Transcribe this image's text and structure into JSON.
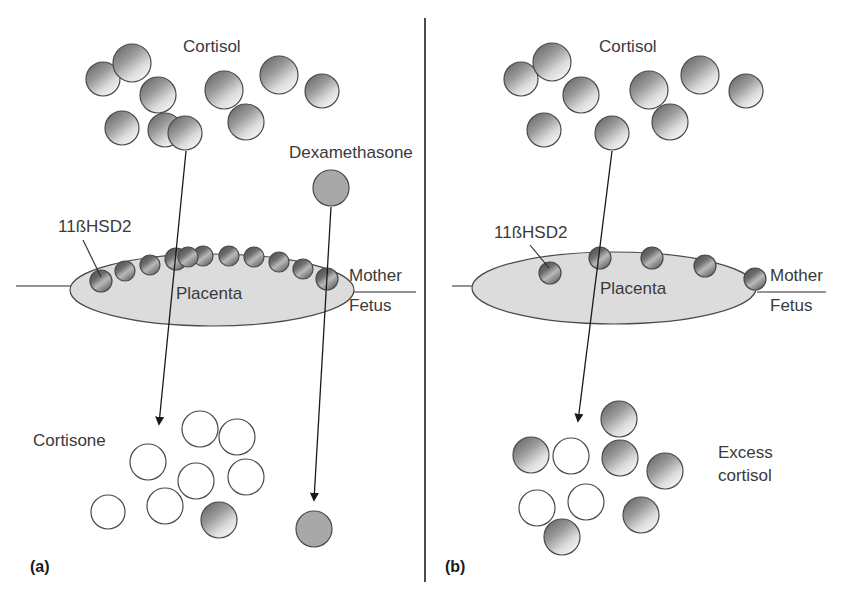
{
  "figure": {
    "width": 842,
    "height": 600,
    "background": "#ffffff",
    "divider": {
      "x": 425,
      "y1": 18,
      "y2": 582
    }
  },
  "colors": {
    "cortisol_dark": "#6f6f6f",
    "cortisol_light": "#f2f2f2",
    "cortisone_fill": "#ffffff",
    "dexamethasone_fill": "#a8a8a8",
    "enzyme_dark": "#4e4e4e",
    "enzyme_light": "#cfcfcf",
    "placenta_fill": "#dcdcdc",
    "outline": "#4a4a4a",
    "text": "#3a3a3a",
    "panel_letter": "#1a1a1a"
  },
  "panels": [
    {
      "id": "panel-a",
      "letter": "(a)",
      "letter_pos": {
        "x": 30,
        "y": 572
      },
      "labels": {
        "cortisol": {
          "text": "Cortisol",
          "x": 183,
          "y": 52
        },
        "dexamethasone": {
          "text": "Dexamethasone",
          "x": 289,
          "y": 158
        },
        "enzyme": {
          "text": "11ßHSD2",
          "x": 58,
          "y": 232
        },
        "placenta": {
          "text": "Placenta",
          "x": 176,
          "y": 299
        },
        "mother": {
          "text": "Mother",
          "x": 349,
          "y": 281
        },
        "fetus": {
          "text": "Fetus",
          "x": 349,
          "y": 311
        },
        "product": {
          "text": "Cortisone",
          "x": 33,
          "y": 446
        }
      },
      "placenta": {
        "cx": 212,
        "cy": 290,
        "rx": 142,
        "ry": 36
      },
      "maternal_line": {
        "x1": 16,
        "y1": 286,
        "x2": 96,
        "y2": 286
      },
      "fetal_line": {
        "x1": 336,
        "y1": 292,
        "x2": 416,
        "y2": 292
      },
      "enzyme_count": 11,
      "enzymes": [
        {
          "cx": 101,
          "cy": 281,
          "r": 11
        },
        {
          "cx": 125,
          "cy": 271,
          "r": 10
        },
        {
          "cx": 150,
          "cy": 265,
          "r": 10
        },
        {
          "cx": 176,
          "cy": 259,
          "r": 11
        },
        {
          "cx": 203,
          "cy": 256,
          "r": 10
        },
        {
          "cx": 229,
          "cy": 256,
          "r": 10
        },
        {
          "cx": 254,
          "cy": 257,
          "r": 10
        },
        {
          "cx": 279,
          "cy": 262,
          "r": 10
        },
        {
          "cx": 303,
          "cy": 269,
          "r": 10
        },
        {
          "cx": 327,
          "cy": 279,
          "r": 11
        },
        {
          "cx": 188,
          "cy": 257,
          "r": 10
        }
      ],
      "enzyme_leader": {
        "x1": 83,
        "y1": 240,
        "x2": 101,
        "y2": 277
      },
      "source_molecules": [
        {
          "cx": 103,
          "cy": 79,
          "r": 17
        },
        {
          "cx": 132,
          "cy": 63,
          "r": 19
        },
        {
          "cx": 158,
          "cy": 95,
          "r": 18
        },
        {
          "cx": 165,
          "cy": 130,
          "r": 17
        },
        {
          "cx": 122,
          "cy": 128,
          "r": 17
        },
        {
          "cx": 224,
          "cy": 90,
          "r": 19
        },
        {
          "cx": 246,
          "cy": 122,
          "r": 18
        },
        {
          "cx": 279,
          "cy": 75,
          "r": 19
        },
        {
          "cx": 322,
          "cy": 91,
          "r": 17
        }
      ],
      "transport_molecule": {
        "cx": 185,
        "cy": 133,
        "r": 17
      },
      "drug_molecule": {
        "cx": 331,
        "cy": 188,
        "r": 18
      },
      "conversion_arrow": {
        "x1": 186,
        "y1": 151,
        "x2": 159,
        "y2": 424
      },
      "drug_arrow": {
        "x1": 331,
        "y1": 207,
        "x2": 314,
        "y2": 500
      },
      "product_molecules": [
        {
          "cx": 200,
          "cy": 429,
          "r": 18,
          "kind": "white"
        },
        {
          "cx": 237,
          "cy": 437,
          "r": 18,
          "kind": "white"
        },
        {
          "cx": 148,
          "cy": 462,
          "r": 18,
          "kind": "white"
        },
        {
          "cx": 196,
          "cy": 481,
          "r": 18,
          "kind": "white"
        },
        {
          "cx": 246,
          "cy": 477,
          "r": 18,
          "kind": "white"
        },
        {
          "cx": 108,
          "cy": 512,
          "r": 17,
          "kind": "white"
        },
        {
          "cx": 165,
          "cy": 506,
          "r": 18,
          "kind": "white"
        },
        {
          "cx": 219,
          "cy": 520,
          "r": 18,
          "kind": "shaded"
        }
      ],
      "drug_product_molecule": {
        "cx": 314,
        "cy": 529,
        "r": 18,
        "kind": "flat"
      }
    },
    {
      "id": "panel-b",
      "letter": "(b)",
      "letter_pos": {
        "x": 445,
        "y": 572
      },
      "labels": {
        "cortisol": {
          "text": "Cortisol",
          "x": 599,
          "y": 52
        },
        "enzyme": {
          "text": "11ßHSD2",
          "x": 494,
          "y": 238
        },
        "placenta": {
          "text": "Placenta",
          "x": 600,
          "y": 294
        },
        "mother": {
          "text": "Mother",
          "x": 770,
          "y": 281
        },
        "fetus": {
          "text": "Fetus",
          "x": 770,
          "y": 311
        },
        "product": {
          "text": "Excess",
          "x": 718,
          "y": 458
        },
        "product_line2": {
          "text": "cortisol",
          "x": 718,
          "y": 481
        }
      },
      "placenta": {
        "cx": 614,
        "cy": 288,
        "rx": 142,
        "ry": 36
      },
      "maternal_line": {
        "x1": 452,
        "y1": 286,
        "x2": 498,
        "y2": 286
      },
      "fetal_line": {
        "x1": 757,
        "y1": 292,
        "x2": 826,
        "y2": 292
      },
      "enzyme_count": 5,
      "enzymes": [
        {
          "cx": 550,
          "cy": 273,
          "r": 11
        },
        {
          "cx": 600,
          "cy": 258,
          "r": 11
        },
        {
          "cx": 652,
          "cy": 258,
          "r": 11
        },
        {
          "cx": 705,
          "cy": 266,
          "r": 11
        },
        {
          "cx": 755,
          "cy": 279,
          "r": 11
        }
      ],
      "enzyme_leader": {
        "x1": 530,
        "y1": 245,
        "x2": 549,
        "y2": 268
      },
      "source_molecules": [
        {
          "cx": 521,
          "cy": 79,
          "r": 17
        },
        {
          "cx": 552,
          "cy": 62,
          "r": 19
        },
        {
          "cx": 581,
          "cy": 95,
          "r": 18
        },
        {
          "cx": 544,
          "cy": 130,
          "r": 17
        },
        {
          "cx": 649,
          "cy": 90,
          "r": 19
        },
        {
          "cx": 670,
          "cy": 122,
          "r": 18
        },
        {
          "cx": 700,
          "cy": 75,
          "r": 19
        },
        {
          "cx": 746,
          "cy": 91,
          "r": 17
        }
      ],
      "transport_molecule": {
        "cx": 612,
        "cy": 133,
        "r": 17
      },
      "conversion_arrow": {
        "x1": 612,
        "y1": 151,
        "x2": 578,
        "y2": 421
      },
      "product_molecules": [
        {
          "cx": 619,
          "cy": 419,
          "r": 18,
          "kind": "shaded"
        },
        {
          "cx": 531,
          "cy": 455,
          "r": 18,
          "kind": "shaded"
        },
        {
          "cx": 571,
          "cy": 456,
          "r": 18,
          "kind": "white"
        },
        {
          "cx": 620,
          "cy": 458,
          "r": 18,
          "kind": "shaded"
        },
        {
          "cx": 665,
          "cy": 471,
          "r": 18,
          "kind": "shaded"
        },
        {
          "cx": 537,
          "cy": 508,
          "r": 18,
          "kind": "white"
        },
        {
          "cx": 586,
          "cy": 502,
          "r": 18,
          "kind": "white"
        },
        {
          "cx": 641,
          "cy": 515,
          "r": 18,
          "kind": "shaded"
        },
        {
          "cx": 562,
          "cy": 537,
          "r": 18,
          "kind": "shaded"
        }
      ]
    }
  ],
  "legend_semantics": {
    "shaded_circle_meaning": "Cortisol",
    "white_circle_meaning": "Cortisone",
    "flat_gray_circle_meaning": "Dexamethasone",
    "small_sphere_meaning": "11ßHSD2 enzyme"
  }
}
